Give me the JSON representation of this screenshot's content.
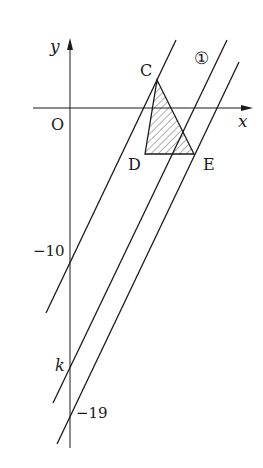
{
  "diagram": {
    "axes": {
      "x_label": "x",
      "y_label": "y",
      "origin_label": "O"
    },
    "points": [
      {
        "name": "C",
        "label": "C"
      },
      {
        "name": "D",
        "label": "D"
      },
      {
        "name": "E",
        "label": "E"
      }
    ],
    "lines": [
      {
        "name": "line-through-C",
        "y_intercept_label": "−10"
      },
      {
        "name": "line-1",
        "marker": "①",
        "y_intercept_label": "k"
      },
      {
        "name": "line-through-E",
        "y_intercept_label": "−19"
      }
    ],
    "shaded_region": "triangle CDE",
    "colors": {
      "stroke": "#1a1a1a",
      "background": "#ffffff"
    }
  }
}
